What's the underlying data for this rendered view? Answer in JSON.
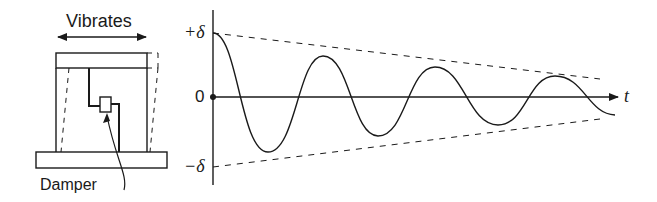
{
  "structure": {
    "motion_label": "Vibrates",
    "damper_label": "Damper"
  },
  "response_plot": {
    "upper_bound_label": "+δ",
    "zero_label": "0",
    "lower_bound_label": "−δ",
    "time_axis_label": "t"
  },
  "colors": {
    "ink": "#1a1a1a",
    "background": "#ffffff"
  }
}
